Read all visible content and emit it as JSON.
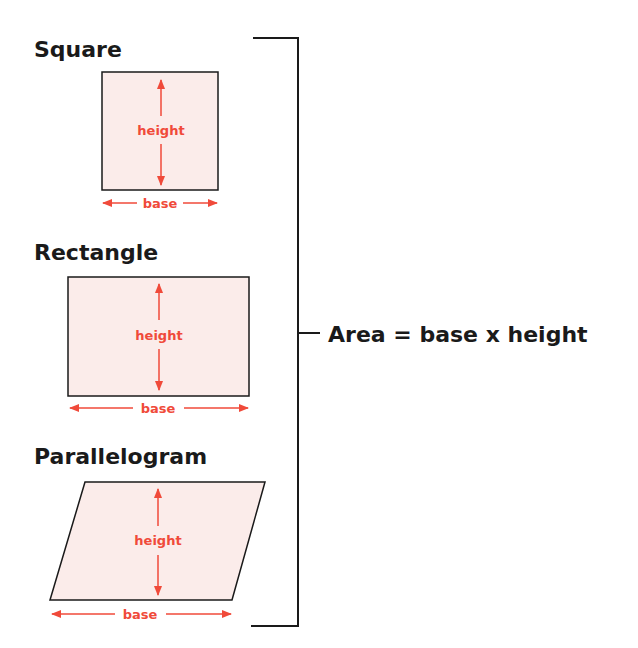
{
  "shapes": {
    "square": {
      "title": "Square",
      "height_label": "height",
      "base_label": "base"
    },
    "rectangle": {
      "title": "Rectangle",
      "height_label": "height",
      "base_label": "base"
    },
    "parallelogram": {
      "title": "Parallelogram",
      "height_label": "height",
      "base_label": "base"
    }
  },
  "formula": "Area = base x height",
  "colors": {
    "accent": "#f04a3a",
    "fill": "#fbecea",
    "stroke": "#1a1a1a"
  }
}
